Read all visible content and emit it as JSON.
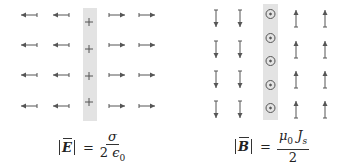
{
  "colors": {
    "arrow": "#555555",
    "strip": "#e3e3e3",
    "symbol": "#555555",
    "text": "#222222"
  },
  "panels": [
    {
      "id": "electric",
      "charge_symbol": "+",
      "charge_count": 4,
      "field_direction_left": "left",
      "field_direction_right": "right",
      "formula": {
        "lhs_bar_left": "|",
        "lhs_symbol": "E",
        "lhs_bar_right": "|",
        "equals": "=",
        "numerator": "σ",
        "denominator_coeff": "2",
        "denominator_symbol": "ϵ",
        "denominator_sub": "0"
      }
    },
    {
      "id": "magnetic",
      "current_symbol": "⊙",
      "current_count": 5,
      "field_direction_left": "down",
      "field_direction_right": "up",
      "formula": {
        "lhs_bar_left": "|",
        "lhs_symbol": "B",
        "lhs_bar_right": "|",
        "equals": "=",
        "numerator_symbol1": "μ",
        "numerator_sub1": "0",
        "numerator_symbol2": "J",
        "numerator_sub2": "s",
        "denominator": "2"
      }
    }
  ]
}
